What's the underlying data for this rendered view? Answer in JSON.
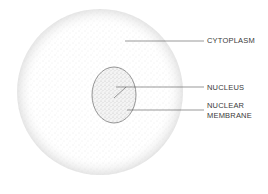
{
  "diagram": {
    "type": "cell-structure",
    "labels": {
      "cytoplasm": "CYTOPLASM",
      "nucleus": "NUCLEUS",
      "membrane_line1": "NUCLEAR",
      "membrane_line2": "MEMBRANE"
    },
    "colors": {
      "background": "#ffffff",
      "stipple": "#b8b8b8",
      "outline": "#6a6a6a",
      "leader": "#555555",
      "text": "#3a3a3a"
    }
  }
}
